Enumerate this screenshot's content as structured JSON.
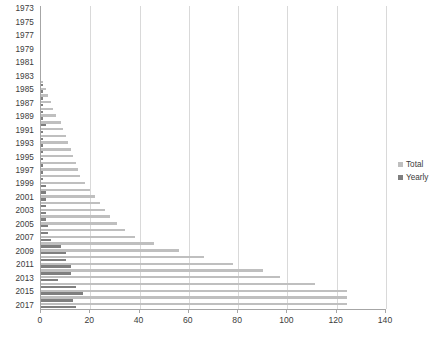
{
  "chart_data": {
    "type": "bar",
    "orientation": "horizontal",
    "title": "",
    "subtitle": "",
    "xlabel": "",
    "ylabel": "",
    "xlim": [
      0,
      140
    ],
    "xticks": [
      0,
      20,
      40,
      60,
      80,
      100,
      120,
      140
    ],
    "xtick_labels": [
      "0",
      "20",
      "40",
      "60",
      "80",
      "100",
      "120",
      "140"
    ],
    "grid": true,
    "grid_axis": "x",
    "legend_position": "right",
    "categories": [
      "1973",
      "1974",
      "1975",
      "1976",
      "1977",
      "1978",
      "1979",
      "1980",
      "1981",
      "1982",
      "1983",
      "1984",
      "1985",
      "1986",
      "1987",
      "1988",
      "1989",
      "1990",
      "1991",
      "1992",
      "1993",
      "1994",
      "1995",
      "1996",
      "1997",
      "1998",
      "1999",
      "2000",
      "2001",
      "2002",
      "2003",
      "2004",
      "2005",
      "2006",
      "2007",
      "2008",
      "2009",
      "2010",
      "2011",
      "2012",
      "2013",
      "2014",
      "2015",
      "2016",
      "2017"
    ],
    "ytick_labels": [
      "1973",
      "1975",
      "1977",
      "1979",
      "1981",
      "1983",
      "1985",
      "1987",
      "1989",
      "1991",
      "1993",
      "1995",
      "1997",
      "1999",
      "2001",
      "2003",
      "2005",
      "2007",
      "2009",
      "2011",
      "2013",
      "2015",
      "2017"
    ],
    "series": [
      {
        "name": "Total",
        "color": "#bfbfbf",
        "values": [
          0,
          0,
          0,
          0,
          0,
          0,
          0,
          0,
          0,
          0,
          0,
          1,
          2,
          3,
          4,
          5,
          6,
          8,
          9,
          10,
          11,
          12,
          13,
          14,
          15,
          16,
          18,
          20,
          22,
          24,
          26,
          28,
          31,
          34,
          38,
          46,
          56,
          66,
          78,
          90,
          97,
          111,
          124,
          124,
          124
        ]
      },
      {
        "name": "Yearly",
        "color": "#7f7f7f",
        "values": [
          0,
          0,
          0,
          0,
          0,
          0,
          0,
          0,
          0,
          0,
          0,
          1,
          1,
          1,
          1,
          1,
          1,
          2,
          1,
          1,
          1,
          1,
          1,
          1,
          1,
          1,
          2,
          2,
          2,
          2,
          2,
          2,
          3,
          3,
          4,
          8,
          10,
          10,
          12,
          12,
          7,
          14,
          17,
          13,
          14
        ]
      }
    ]
  },
  "legend": {
    "entries": [
      {
        "label": "Total",
        "color": "#bfbfbf"
      },
      {
        "label": "Yearly",
        "color": "#7f7f7f"
      }
    ]
  }
}
